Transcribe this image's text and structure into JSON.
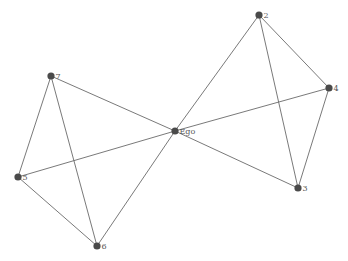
{
  "diagram": {
    "type": "ego-network",
    "colors": {
      "edge": "#6a6a6a",
      "node": "#4a4a4a",
      "label": "#555555",
      "background": "#ffffff"
    },
    "nodes": [
      {
        "id": "Ego",
        "label": "Ego",
        "x": 175,
        "y": 131
      },
      {
        "id": "2",
        "label": "2",
        "x": 259,
        "y": 15
      },
      {
        "id": "4",
        "label": "4",
        "x": 329,
        "y": 88
      },
      {
        "id": "3",
        "label": "3",
        "x": 298,
        "y": 188
      },
      {
        "id": "7",
        "label": "7",
        "x": 51,
        "y": 76
      },
      {
        "id": "5",
        "label": "5",
        "x": 18,
        "y": 177
      },
      {
        "id": "6",
        "label": "6",
        "x": 97,
        "y": 246
      }
    ],
    "edges": [
      [
        "Ego",
        "2"
      ],
      [
        "Ego",
        "4"
      ],
      [
        "Ego",
        "3"
      ],
      [
        "Ego",
        "7"
      ],
      [
        "Ego",
        "5"
      ],
      [
        "Ego",
        "6"
      ],
      [
        "2",
        "4"
      ],
      [
        "2",
        "3"
      ],
      [
        "4",
        "3"
      ],
      [
        "7",
        "5"
      ],
      [
        "7",
        "6"
      ],
      [
        "5",
        "6"
      ]
    ]
  }
}
